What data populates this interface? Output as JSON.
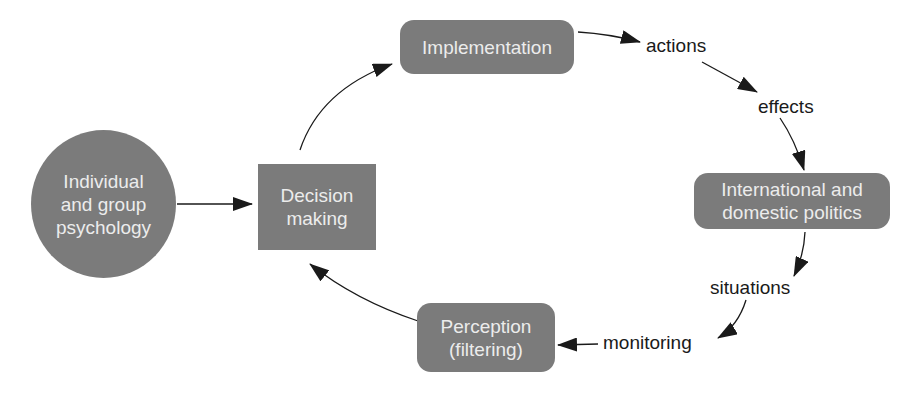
{
  "diagram": {
    "nodes": {
      "psychology": {
        "text": "Individual\nand group\npsychology",
        "shape": "circle"
      },
      "decision": {
        "text": "Decision\nmaking",
        "shape": "rectangle"
      },
      "implementation": {
        "text": "Implementation",
        "shape": "rounded-rectangle"
      },
      "politics": {
        "text": "International and\ndomestic politics",
        "shape": "rounded-rectangle"
      },
      "perception": {
        "text": "Perception\n(filtering)",
        "shape": "rounded-rectangle"
      }
    },
    "labels": {
      "actions": "actions",
      "effects": "effects",
      "situations": "situations",
      "monitoring": "monitoring"
    },
    "edges": [
      {
        "from": "psychology",
        "to": "decision"
      },
      {
        "from": "decision",
        "to": "implementation"
      },
      {
        "from": "implementation",
        "to": "actions"
      },
      {
        "from": "actions",
        "to": "effects"
      },
      {
        "from": "effects",
        "to": "politics"
      },
      {
        "from": "politics",
        "to": "situations"
      },
      {
        "from": "situations",
        "to": "monitoring"
      },
      {
        "from": "monitoring",
        "to": "perception"
      },
      {
        "from": "perception",
        "to": "decision"
      }
    ],
    "colors": {
      "node_fill": "#7b7b7b",
      "node_text": "#ececec",
      "edge": "#1a1a1a"
    }
  }
}
